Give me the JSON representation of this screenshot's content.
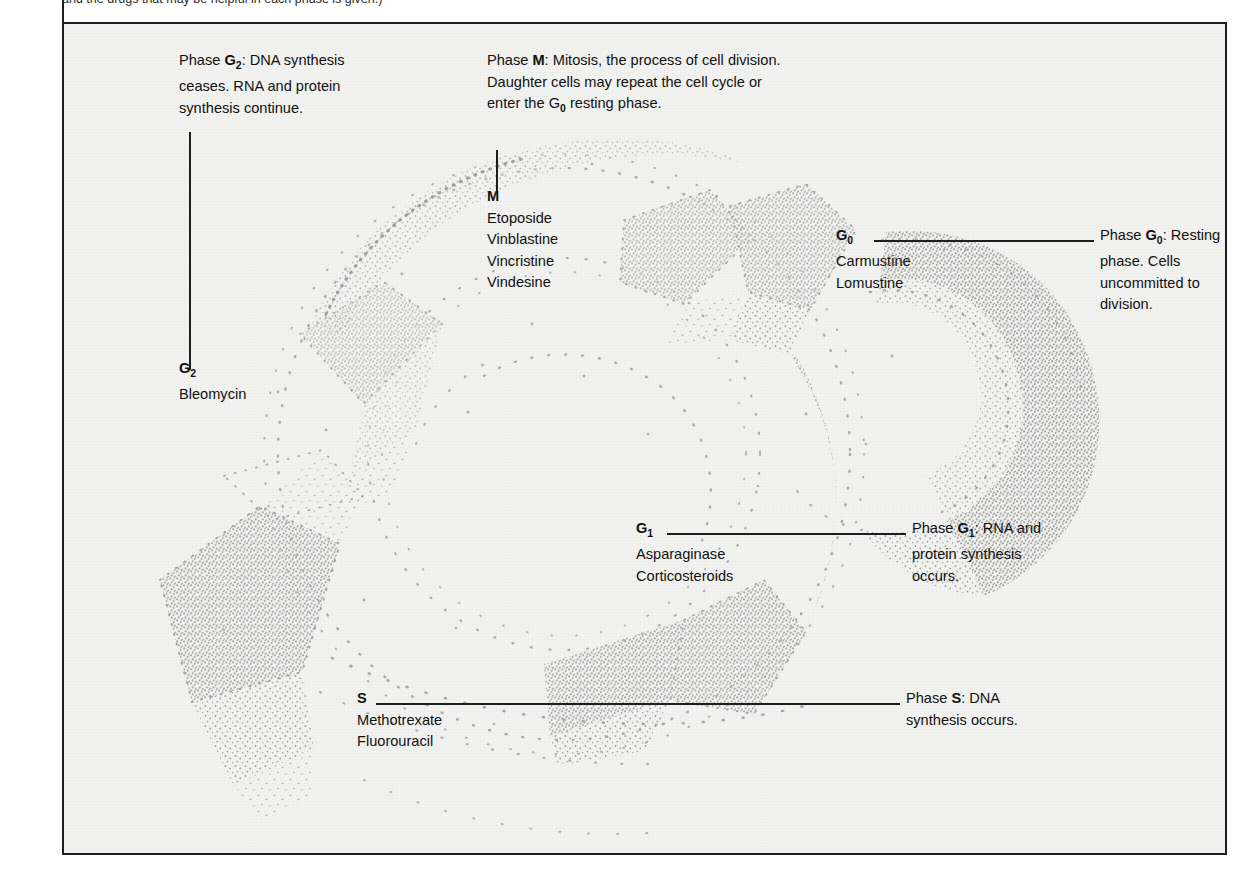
{
  "figure": {
    "caption_cropped": "and the drugs that may be helpful in each phase is given.)",
    "background_color": "#f2f2f0",
    "frame_color": "#1d1d1d",
    "stipple_color": "#9a9a9a",
    "text_color": "#111111"
  },
  "phases": {
    "g2": {
      "label": "G",
      "subscript": "2",
      "note_prefix": "Phase ",
      "note_key": "G",
      "note_sub": "2",
      "note_body": ": DNA synthesis ceases. RNA and protein synthesis continue.",
      "drugs": [
        "Bleomycin"
      ]
    },
    "m": {
      "label": "M",
      "subscript": "",
      "note_prefix": "Phase ",
      "note_key": "M",
      "note_sub": "",
      "note_body": ": Mitosis, the process of cell division. Daughter cells may repeat the cell cycle or enter the G",
      "note_body2": " resting phase.",
      "note_body2_sub": "0",
      "drugs": [
        "Etoposide",
        "Vinblastine",
        "Vincristine",
        "Vindesine"
      ]
    },
    "g0": {
      "label": "G",
      "subscript": "0",
      "note_prefix": "Phase ",
      "note_key": "G",
      "note_sub": "0",
      "note_body": ": Resting phase. Cells uncommitted to division.",
      "drugs": [
        "Carmustine",
        "Lomustine"
      ]
    },
    "g1": {
      "label": "G",
      "subscript": "1",
      "note_prefix": "Phase ",
      "note_key": "G",
      "note_sub": "1",
      "note_body": ": RNA and protein synthesis occurs.",
      "drugs": [
        "Asparaginase",
        "Corticosteroids"
      ]
    },
    "s": {
      "label": "S",
      "subscript": "",
      "note_prefix": "Phase ",
      "note_key": "S",
      "note_sub": "",
      "note_body": ": DNA synthesis occurs.",
      "drugs": [
        "Methotrexate",
        "Fluorouracil"
      ]
    }
  },
  "diagram_data": {
    "type": "cell-cycle-wheel",
    "description": "Stippled ring diagram of the cell cycle with wedge segments for G1, S, G2 and M, plus a separate G0 crescent at right.",
    "segments": [
      {
        "phase": "M",
        "start_deg": -58,
        "end_deg": -14
      },
      {
        "phase": "G2",
        "start_deg": -150,
        "end_deg": -100
      },
      {
        "phase": "S",
        "start_deg": 120,
        "end_deg": 186
      },
      {
        "phase": "G1",
        "start_deg": 46,
        "end_deg": 104
      },
      {
        "phase": "G0",
        "start_deg": -44,
        "end_deg": 70,
        "detached": true
      }
    ]
  }
}
